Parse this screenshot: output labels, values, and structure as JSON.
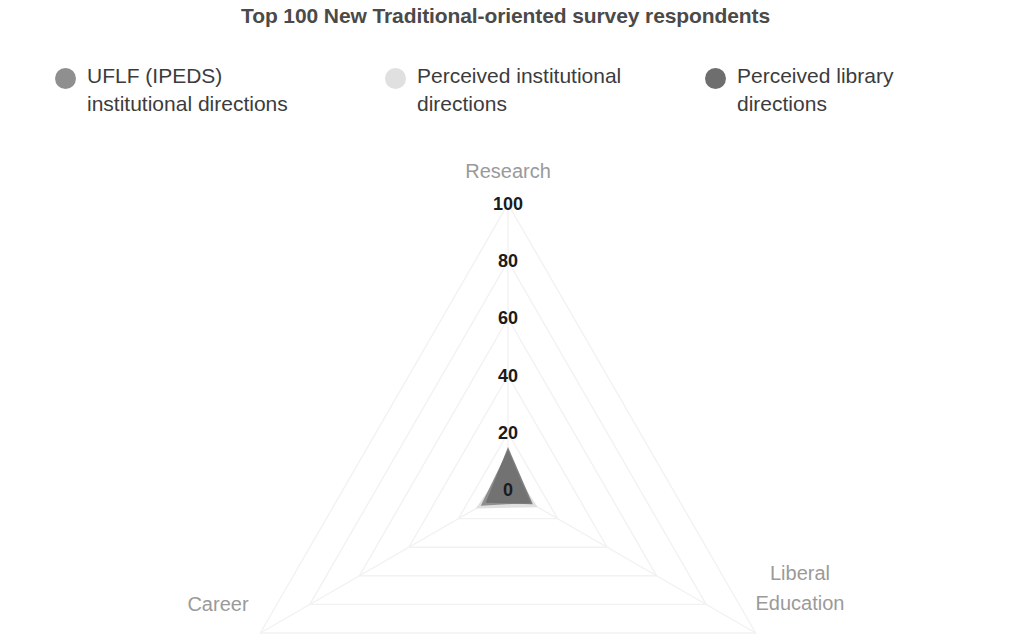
{
  "chart_data": {
    "type": "radar",
    "title": "Top 100 New Traditional-oriented survey respondents",
    "axes": [
      "Research",
      "Liberal Education",
      "Career"
    ],
    "categories": [
      "Research",
      "Liberal Education",
      "Career"
    ],
    "tick_labels": [
      "100",
      "80",
      "60",
      "40",
      "20",
      "0"
    ],
    "tick_values": [
      100,
      80,
      60,
      40,
      20,
      0
    ],
    "rlim": [
      0,
      100
    ],
    "radial_axis_inverted": true,
    "grid": true,
    "legend_position": "top",
    "xlabel": "",
    "ylabel": "",
    "series": [
      {
        "name": "UFLF (IPEDS) institutional directions",
        "color": "#8f8f8f",
        "values": [
          14,
          9,
          11
        ]
      },
      {
        "name": "Perceived institutional directions",
        "color": "#e0e0e0",
        "values": [
          10,
          12,
          13
        ]
      },
      {
        "name": "Perceived library directions",
        "color": "#6e6e6e",
        "values": [
          15,
          10,
          9
        ]
      }
    ]
  },
  "chart": {
    "title": "Top 100 New Traditional-oriented survey respondents",
    "axis_labels": {
      "research": "Research",
      "liberal_education_line1": "Liberal",
      "liberal_education_line2": "Education",
      "career": "Career"
    },
    "ticks": [
      "100",
      "80",
      "60",
      "40",
      "20",
      "0"
    ],
    "colors": {
      "series_1": "#8f8f8f",
      "series_2": "#e0e0e0",
      "series_3": "#6e6e6e",
      "grid": "#f2f2f2",
      "title_text": "#4a4a4a",
      "axis_text": "#9a9a9a",
      "tick_text": "#1b1b1b",
      "background": "#ffffff"
    }
  },
  "legend": {
    "items": [
      {
        "label_line1": "UFLF (IPEDS)",
        "label_line2": "institutional directions",
        "color": "#8f8f8f",
        "name": "uflf-ipeds-institutional-directions"
      },
      {
        "label_line1": "Perceived institutional",
        "label_line2": "directions",
        "color": "#e0e0e0",
        "name": "perceived-institutional-directions"
      },
      {
        "label_line1": "Perceived library",
        "label_line2": "directions",
        "color": "#6e6e6e",
        "name": "perceived-library-directions"
      }
    ]
  }
}
